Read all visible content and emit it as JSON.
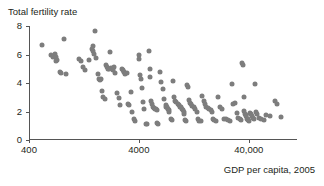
{
  "chart_data": {
    "type": "scatter",
    "title": "Total fertility rate",
    "xlabel": "GDP per capita, 2005",
    "ylabel": "Total fertility rate",
    "xscale": "log",
    "xlim": [
      400,
      110000
    ],
    "ylim": [
      0,
      8
    ],
    "grid": false,
    "legend": null,
    "marker_color": "#7d7d7d",
    "axis_color": "#555555",
    "xticks": [
      {
        "value": 400,
        "label": "400"
      },
      {
        "value": 4000,
        "label": "4000"
      },
      {
        "value": 40000,
        "label": "40,000"
      }
    ],
    "yticks": [
      {
        "value": 0,
        "label": "0"
      },
      {
        "value": 2,
        "label": "2"
      },
      {
        "value": 4,
        "label": "4"
      },
      {
        "value": 6,
        "label": "6"
      },
      {
        "value": 8,
        "label": "8"
      }
    ],
    "points": [
      [
        520,
        6.7
      ],
      [
        640,
        6.0
      ],
      [
        660,
        5.85
      ],
      [
        690,
        6.05
      ],
      [
        700,
        5.8
      ],
      [
        700,
        5.55
      ],
      [
        720,
        5.6
      ],
      [
        760,
        4.8
      ],
      [
        790,
        4.7
      ],
      [
        840,
        7.1
      ],
      [
        870,
        4.6
      ],
      [
        1150,
        5.7
      ],
      [
        1200,
        5.55
      ],
      [
        1230,
        5.1
      ],
      [
        1280,
        4.9
      ],
      [
        1400,
        5.6
      ],
      [
        1500,
        6.4
      ],
      [
        1520,
        6.25
      ],
      [
        1540,
        6.6
      ],
      [
        1560,
        6.05
      ],
      [
        1600,
        7.65
      ],
      [
        1640,
        5.75
      ],
      [
        1700,
        4.6
      ],
      [
        1720,
        4.3
      ],
      [
        1760,
        4.2
      ],
      [
        1800,
        4.25
      ],
      [
        1850,
        3.45
      ],
      [
        1900,
        3.0
      ],
      [
        1950,
        2.9
      ],
      [
        2000,
        5.25
      ],
      [
        2050,
        5.1
      ],
      [
        2100,
        5.0
      ],
      [
        2150,
        4.95
      ],
      [
        2200,
        6.15
      ],
      [
        2250,
        5.05
      ],
      [
        2300,
        4.95
      ],
      [
        2350,
        4.9
      ],
      [
        2400,
        5.1
      ],
      [
        2450,
        4.7
      ],
      [
        2550,
        3.3
      ],
      [
        2650,
        2.95
      ],
      [
        2700,
        2.45
      ],
      [
        2800,
        4.95
      ],
      [
        2850,
        4.9
      ],
      [
        2900,
        4.75
      ],
      [
        2950,
        4.8
      ],
      [
        3000,
        4.6
      ],
      [
        3100,
        4.7
      ],
      [
        3200,
        2.5
      ],
      [
        3250,
        2.45
      ],
      [
        3400,
        3.35
      ],
      [
        3500,
        1.95
      ],
      [
        3600,
        1.45
      ],
      [
        3700,
        1.35
      ],
      [
        4000,
        5.7
      ],
      [
        4050,
        6.0
      ],
      [
        4100,
        4.55
      ],
      [
        4200,
        4.3
      ],
      [
        4300,
        3.65
      ],
      [
        4400,
        2.65
      ],
      [
        4500,
        2.15
      ],
      [
        4600,
        1.1
      ],
      [
        4700,
        1.15
      ],
      [
        4900,
        6.25
      ],
      [
        5000,
        5.0
      ],
      [
        5100,
        4.4
      ],
      [
        5200,
        2.75
      ],
      [
        5300,
        2.55
      ],
      [
        5400,
        2.3
      ],
      [
        5500,
        2.25
      ],
      [
        5600,
        2.2
      ],
      [
        5700,
        2.15
      ],
      [
        5800,
        2.1
      ],
      [
        5900,
        1.2
      ],
      [
        6000,
        1.15
      ],
      [
        6200,
        4.75
      ],
      [
        6400,
        4.1
      ],
      [
        6600,
        3.55
      ],
      [
        6800,
        2.85
      ],
      [
        7000,
        2.45
      ],
      [
        7100,
        2.35
      ],
      [
        7200,
        2.3
      ],
      [
        7300,
        2.2
      ],
      [
        7400,
        2.15
      ],
      [
        7500,
        2.1
      ],
      [
        7600,
        1.95
      ],
      [
        7800,
        1.45
      ],
      [
        8000,
        1.4
      ],
      [
        8200,
        4.15
      ],
      [
        8400,
        3.0
      ],
      [
        8600,
        2.75
      ],
      [
        8800,
        2.65
      ],
      [
        9000,
        2.5
      ],
      [
        9200,
        2.45
      ],
      [
        9400,
        2.35
      ],
      [
        9600,
        2.3
      ],
      [
        9800,
        2.2
      ],
      [
        10000,
        2.1
      ],
      [
        10200,
        1.95
      ],
      [
        10400,
        1.85
      ],
      [
        10600,
        1.4
      ],
      [
        10800,
        1.3
      ],
      [
        11000,
        3.85
      ],
      [
        11200,
        3.7
      ],
      [
        11500,
        2.8
      ],
      [
        11800,
        2.6
      ],
      [
        12000,
        2.5
      ],
      [
        12300,
        2.4
      ],
      [
        12600,
        2.3
      ],
      [
        13000,
        2.15
      ],
      [
        13400,
        2.0
      ],
      [
        13800,
        1.45
      ],
      [
        14200,
        1.35
      ],
      [
        14600,
        1.3
      ],
      [
        15000,
        3.1
      ],
      [
        15500,
        2.75
      ],
      [
        16000,
        2.5
      ],
      [
        16500,
        2.35
      ],
      [
        17000,
        2.25
      ],
      [
        17500,
        2.2
      ],
      [
        18000,
        2.1
      ],
      [
        18500,
        1.95
      ],
      [
        19000,
        1.5
      ],
      [
        19500,
        1.4
      ],
      [
        20000,
        1.3
      ],
      [
        21000,
        3.05
      ],
      [
        22000,
        2.35
      ],
      [
        23000,
        2.2
      ],
      [
        24000,
        1.5
      ],
      [
        25000,
        1.45
      ],
      [
        26000,
        1.4
      ],
      [
        27000,
        1.3
      ],
      [
        28000,
        3.9
      ],
      [
        29000,
        2.5
      ],
      [
        30000,
        2.6
      ],
      [
        31000,
        1.9
      ],
      [
        32000,
        1.55
      ],
      [
        33000,
        1.45
      ],
      [
        34000,
        1.4
      ],
      [
        35000,
        5.4
      ],
      [
        35500,
        5.25
      ],
      [
        36000,
        3.0
      ],
      [
        36500,
        2.05
      ],
      [
        37000,
        1.85
      ],
      [
        37500,
        1.75
      ],
      [
        38000,
        1.65
      ],
      [
        38500,
        1.5
      ],
      [
        39000,
        1.45
      ],
      [
        39500,
        1.4
      ],
      [
        40000,
        1.35
      ],
      [
        41000,
        1.9
      ],
      [
        42000,
        1.8
      ],
      [
        43000,
        1.7
      ],
      [
        44000,
        1.55
      ],
      [
        45000,
        1.45
      ],
      [
        46000,
        3.95
      ],
      [
        47000,
        2.0
      ],
      [
        48000,
        1.85
      ],
      [
        50000,
        1.55
      ],
      [
        52000,
        1.5
      ],
      [
        55000,
        1.4
      ],
      [
        58000,
        1.75
      ],
      [
        62000,
        1.65
      ],
      [
        70000,
        2.75
      ],
      [
        72000,
        2.5
      ],
      [
        78000,
        1.6
      ]
    ]
  }
}
